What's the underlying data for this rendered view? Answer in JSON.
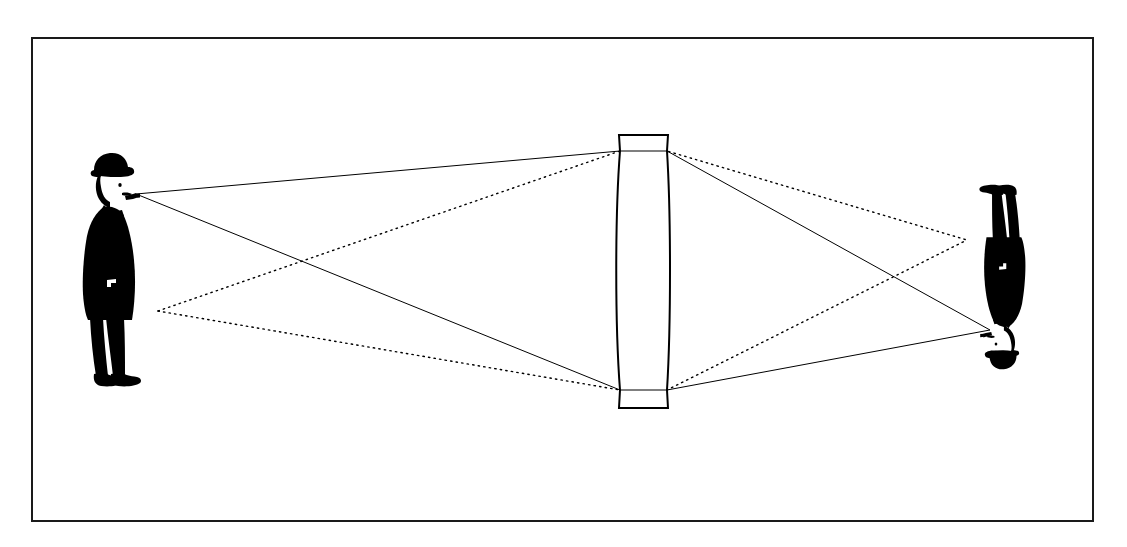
{
  "figure": {
    "description": "A man in a bowler hat smoking a pipe stands at left; rays pass through a biconvex lens at center and form an inverted image of the man at right.",
    "background_color": "#ffffff",
    "ink_color": "#000000",
    "canvas": {
      "width": 1127,
      "height": 547
    }
  },
  "border": {
    "name": "figure-border",
    "x": 32,
    "y": 38,
    "width": 1061,
    "height": 483,
    "stroke": "#1a1a1a",
    "stroke_width": 2,
    "fill": "none"
  },
  "object_figure": {
    "label": "man-with-pipe-object",
    "orientation": "upright",
    "facing": "right",
    "bounds": {
      "x": 80,
      "y": 152,
      "width": 80,
      "height": 238
    },
    "fill": "#000000",
    "ray_origin_head": {
      "x": 136,
      "y": 194
    },
    "ray_origin_feet": {
      "x": 158,
      "y": 311
    }
  },
  "image_figure": {
    "label": "man-with-pipe-image",
    "orientation": "inverted",
    "facing": "right",
    "bounds": {
      "x": 972,
      "y": 182,
      "width": 48,
      "height": 188
    },
    "fill": "#000000",
    "ray_converge_head": {
      "x": 990,
      "y": 330
    },
    "ray_converge_feet": {
      "x": 967,
      "y": 240
    }
  },
  "lens": {
    "label": "biconvex-converging-lens",
    "type": "biconvex",
    "center_x": 643,
    "top_y": 135,
    "bottom_y": 408,
    "rim_top_y": 151,
    "rim_bottom_y": 390,
    "rim_left_x": 620,
    "rim_right_x": 667,
    "flange_left_x": 619,
    "flange_right_x": 668,
    "max_half_width": 28,
    "stroke": "#000000",
    "stroke_width": 2,
    "fill": "#ffffff"
  },
  "rays": {
    "solid_style": {
      "name": "solid-ray",
      "stroke": "#000000",
      "stroke_width": 1,
      "dash": "none"
    },
    "dotted_style": {
      "name": "dotted-ray",
      "stroke": "#000000",
      "stroke_width": 1.4,
      "dash": "1.4 4.2"
    },
    "paths": [
      {
        "id": "ray-head-upper",
        "style": "solid",
        "from": [
          136,
          194
        ],
        "via": [
          620,
          151
        ],
        "to": [
          990,
          330
        ],
        "note": "head ray to top of lens, refracted down to inverted head"
      },
      {
        "id": "ray-head-lower",
        "style": "solid",
        "from": [
          136,
          194
        ],
        "via": [
          620,
          390
        ],
        "to": [
          990,
          330
        ],
        "note": "head ray to bottom of lens, refracted up to inverted head"
      },
      {
        "id": "ray-feet-upper",
        "style": "dotted",
        "from": [
          158,
          311
        ],
        "via": [
          620,
          151
        ],
        "to": [
          967,
          240
        ],
        "note": "feet ray to top of lens, refracted down to inverted feet"
      },
      {
        "id": "ray-feet-lower",
        "style": "dotted",
        "from": [
          158,
          311
        ],
        "via": [
          620,
          390
        ],
        "to": [
          967,
          240
        ],
        "note": "feet ray to bottom of lens, refracted up to inverted feet"
      }
    ]
  },
  "annotations": {
    "visible_text": []
  }
}
